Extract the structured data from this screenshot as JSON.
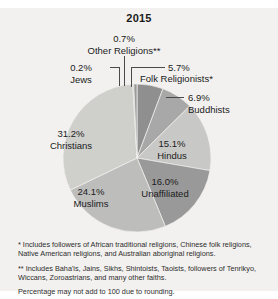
{
  "chart_data": {
    "type": "pie",
    "title": "2015",
    "xlabel": "",
    "ylabel": "",
    "legend_position": "callout-labels",
    "grid": false,
    "units": "percent",
    "categories": [
      "Folk Religionists*",
      "Buddhists",
      "Hindus",
      "Unaffiliated",
      "Muslims",
      "Christians",
      "Jews",
      "Other Religions**"
    ],
    "values": [
      5.7,
      6.9,
      15.1,
      16.0,
      24.1,
      31.2,
      0.2,
      0.7
    ],
    "slices": [
      {
        "name": "Folk Religionists*",
        "value": 5.7,
        "label": "5.7%",
        "color": "#8f8f8f"
      },
      {
        "name": "Buddhists",
        "value": 6.9,
        "label": "6.9%",
        "color": "#a8a8a8"
      },
      {
        "name": "Hindus",
        "value": 15.1,
        "label": "15.1%",
        "color": "#c8c8c6"
      },
      {
        "name": "Unaffiliated",
        "value": 16.0,
        "label": "16.0%",
        "color": "#999999"
      },
      {
        "name": "Muslims",
        "value": 24.1,
        "label": "24.1%",
        "color": "#bdbdbb"
      },
      {
        "name": "Christians",
        "value": 31.2,
        "label": "31.2%",
        "color": "#cfcfcc"
      },
      {
        "name": "Jews",
        "value": 0.2,
        "label": "0.2%",
        "color": "#b0b0ae"
      },
      {
        "name": "Other Religions**",
        "value": 0.7,
        "label": "0.7%",
        "color": "#9a9a98"
      }
    ]
  },
  "labels": {
    "other_religions": {
      "pct": "0.7%",
      "name": "Other Religions**"
    },
    "jews": {
      "pct": "0.2%",
      "name": "Jews"
    },
    "folk": {
      "pct": "5.7%",
      "name": "Folk Religionists*"
    },
    "buddhists": {
      "pct": "6.9%",
      "name": "Buddhists"
    },
    "hindus": {
      "pct": "15.1%",
      "name": "Hindus"
    },
    "unaffiliated": {
      "pct": "16.0%",
      "name": "Unaffiliated"
    },
    "muslims": {
      "pct": "24.1%",
      "name": "Muslims"
    },
    "christians": {
      "pct": "31.2%",
      "name": "Christians"
    }
  },
  "footnotes": [
    "* Includes followers of African traditional religions, Chinese folk religions, Native American religions, and Australian aboriginal religions.",
    "** Includes Baha'is, Jains, Sikhs, Shintoists, Taoists, followers of Tenrikyo, Wiccans, Zoroastrians, and many other faiths.",
    "Percentage may not add to 100 due to rounding."
  ],
  "colors": {
    "background": "#f2f1ef",
    "text": "#1b1b1b",
    "leader_line": "#4a4a4a"
  }
}
